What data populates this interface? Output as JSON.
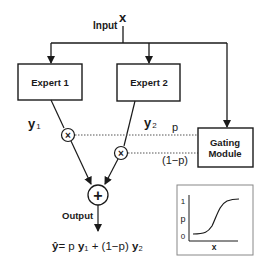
{
  "diagram": {
    "input": {
      "label": "Input",
      "symbol": "x"
    },
    "experts": [
      {
        "label": "Expert 1",
        "output": "y",
        "subscript": "1"
      },
      {
        "label": "Expert 2",
        "output": "y",
        "subscript": "2"
      }
    ],
    "gating": {
      "line1": "Gating",
      "line2": "Module",
      "p_label": "p",
      "one_minus_p_label": "(1−p)"
    },
    "nodes": {
      "multiply_symbol": "×",
      "sum_symbol": "+"
    },
    "output": {
      "label": "Output"
    },
    "formula": {
      "lhs": "ŷ",
      "eq": "= p ",
      "y1": "y",
      "sub1": "1",
      "mid": " + (1−p) ",
      "y2": "y",
      "sub2": "2"
    },
    "inset": {
      "y_tick_top": "1",
      "y_tick_bottom": "0",
      "ylabel": "p",
      "xlabel": "x"
    }
  },
  "colors": {
    "stroke": "#1a1a1a",
    "dotted": "#666666",
    "background": "#ffffff"
  }
}
